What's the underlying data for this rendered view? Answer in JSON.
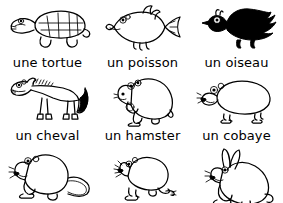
{
  "worksheet": {
    "language": "fr",
    "background_color": "#ffffff",
    "ink_color": "#000000",
    "columns": 3,
    "rows": 3,
    "items": [
      {
        "label": "une tortue",
        "animal": "turtle",
        "icon": "turtle-illustration",
        "style": "line-drawing"
      },
      {
        "label": "un poisson",
        "animal": "fish",
        "icon": "fish-illustration",
        "style": "line-drawing"
      },
      {
        "label": "un oiseau",
        "animal": "bird",
        "icon": "bird-illustration",
        "style": "black-silhouette"
      },
      {
        "label": "un cheval",
        "animal": "horse",
        "icon": "horse-illustration",
        "style": "line-drawing"
      },
      {
        "label": "un hamster",
        "animal": "hamster",
        "icon": "hamster-illustration",
        "style": "line-drawing"
      },
      {
        "label": "un cobaye",
        "animal": "guinea-pig",
        "icon": "guinea-pig-illustration",
        "style": "line-drawing"
      },
      {
        "label": "",
        "animal": "rat",
        "icon": "rat-illustration",
        "style": "line-drawing"
      },
      {
        "label": "",
        "animal": "mouse",
        "icon": "mouse-illustration",
        "style": "line-drawing"
      },
      {
        "label": "",
        "animal": "rabbit",
        "icon": "rabbit-illustration",
        "style": "line-drawing"
      }
    ]
  }
}
